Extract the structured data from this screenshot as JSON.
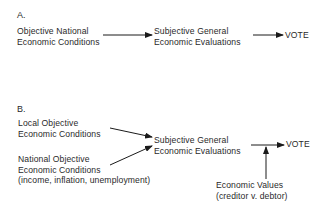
{
  "panel_a": {
    "label": "A.",
    "source": {
      "line1": "Objective National",
      "line2": "Economic Conditions"
    },
    "mediator": {
      "line1": "Subjective General",
      "line2": "Economic Evaluations"
    },
    "outcome": "VOTE"
  },
  "panel_b": {
    "label": "B.",
    "local": {
      "line1": "Local Objective",
      "line2": "Economic Conditions"
    },
    "national": {
      "line1": "National Objective",
      "line2": "Economic Conditions",
      "line3": "(income, inflation, unemployment)"
    },
    "mediator": {
      "line1": "Subjective General",
      "line2": "Economic Evaluations"
    },
    "outcome": "VOTE",
    "moderator": {
      "line1": "Economic Values",
      "line2": "(creditor v. debtor)"
    }
  },
  "colors": {
    "text": "#2a2a2a",
    "arrow": "#1a1a1a",
    "background": "#ffffff"
  }
}
